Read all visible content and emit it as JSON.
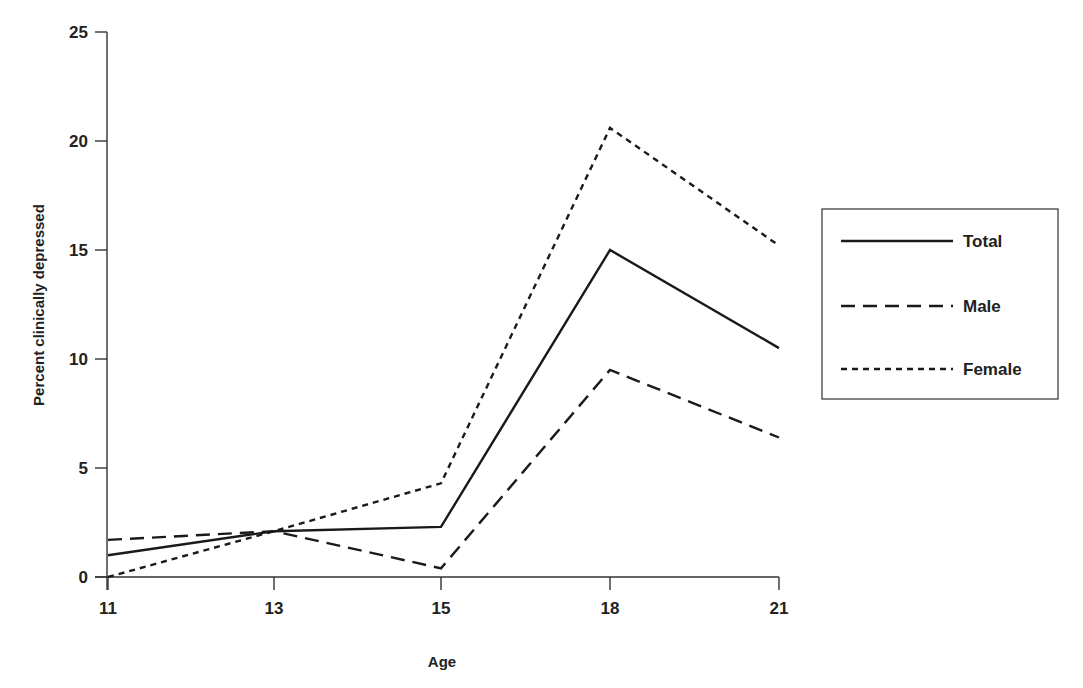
{
  "chart_data": {
    "type": "line",
    "title": "",
    "xlabel": "Age",
    "ylabel": "Percent clinically depressed",
    "categories": [
      "11",
      "13",
      "15",
      "18",
      "21"
    ],
    "x": [
      11,
      13,
      15,
      18,
      21
    ],
    "ylim": [
      0,
      25
    ],
    "yticks": [
      0,
      5,
      10,
      15,
      20,
      25
    ],
    "grid": false,
    "legend_position": "right",
    "series": [
      {
        "name": "Total",
        "line_style": "solid",
        "values": [
          1.0,
          2.1,
          2.3,
          15.0,
          10.5
        ]
      },
      {
        "name": "Male",
        "line_style": "dashed",
        "values": [
          1.7,
          2.1,
          0.4,
          9.5,
          6.4
        ]
      },
      {
        "name": "Female",
        "line_style": "dotted",
        "values": [
          0.0,
          2.1,
          4.3,
          20.6,
          15.2
        ]
      }
    ]
  },
  "axes": {
    "x_title": "Age",
    "y_title": "Percent clinically depressed",
    "x_tick_labels": [
      "11",
      "13",
      "15",
      "18",
      "21"
    ],
    "y_tick_labels": [
      "0",
      "5",
      "10",
      "15",
      "20",
      "25"
    ]
  },
  "legend": {
    "items": [
      {
        "label": "Total"
      },
      {
        "label": "Male"
      },
      {
        "label": "Female"
      }
    ]
  },
  "colors": {
    "line": "#1a1a1a",
    "axis": "#333333",
    "background": "#ffffff"
  }
}
